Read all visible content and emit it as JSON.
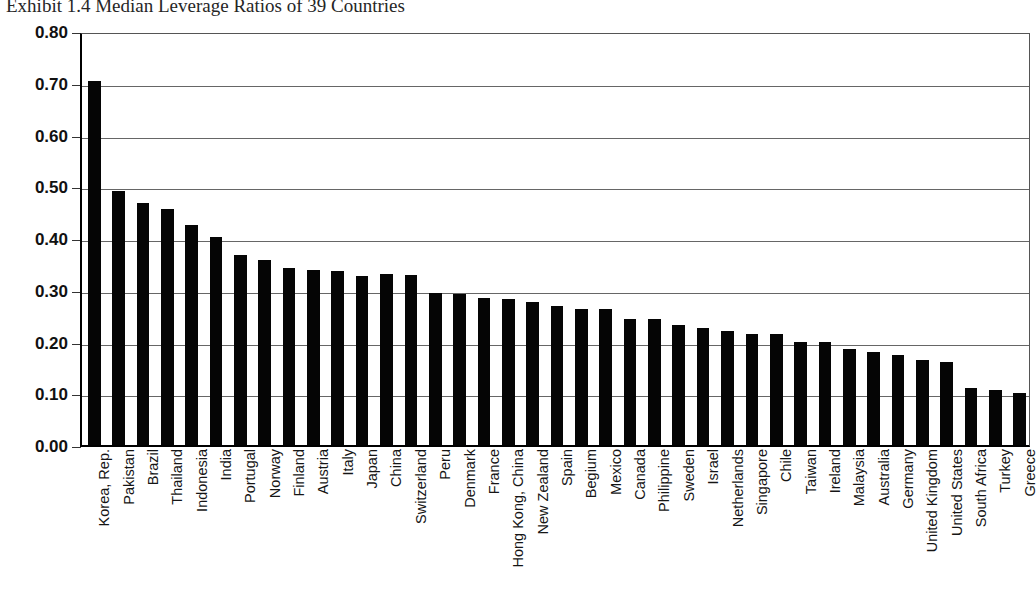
{
  "title": "Exhibit 1.4  Median Leverage Ratios of 39 Countries",
  "ghost_marks": {
    "top_right": "",
    "mid_left": ""
  },
  "axis": {
    "y_ticks": [
      "0.80",
      "0.70",
      "0.60",
      "0.50",
      "0.40",
      "0.30",
      "0.20",
      "0.10",
      "0.00"
    ]
  },
  "chart_data": {
    "type": "bar",
    "title": "Exhibit 1.4  Median Leverage Ratios of 39 Countries",
    "xlabel": "",
    "ylabel": "",
    "ylim": [
      0.0,
      0.8
    ],
    "ytick_step": 0.1,
    "grid": true,
    "legend": false,
    "orientation": "vertical",
    "bar_color": "#050505",
    "sorted": "descending",
    "categories": [
      "Korea, Rep.",
      "Pakistan",
      "Brazil",
      "Thailand",
      "Indonesia",
      "India",
      "Portugal",
      "Norway",
      "Finland",
      "Austria",
      "Italy",
      "Japan",
      "China",
      "Switzerland",
      "Peru",
      "Denmark",
      "France",
      "Hong Kong, China",
      "New Zealand",
      "Spain",
      "Begium",
      "Mexico",
      "Canada",
      "Philippine",
      "Sweden",
      "Israel",
      "Netherlands",
      "Singapore",
      "Chile",
      "Taiwan",
      "Ireland",
      "Malaysia",
      "Australia",
      "Germany",
      "United Kingdom",
      "United States",
      "South Africa",
      "Turkey",
      "Greece"
    ],
    "values": [
      0.703,
      0.49,
      0.468,
      0.456,
      0.425,
      0.401,
      0.368,
      0.357,
      0.343,
      0.338,
      0.337,
      0.327,
      0.33,
      0.328,
      0.294,
      0.291,
      0.284,
      0.282,
      0.276,
      0.268,
      0.263,
      0.262,
      0.244,
      0.244,
      0.231,
      0.226,
      0.22,
      0.214,
      0.215,
      0.199,
      0.199,
      0.185,
      0.18,
      0.173,
      0.164,
      0.16,
      0.11,
      0.107,
      0.101
    ]
  }
}
